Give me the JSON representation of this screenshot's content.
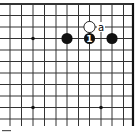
{
  "diagram": {
    "type": "go-board-corner",
    "colors": {
      "line": "#333333",
      "edge": "#111111",
      "black_stone": "#111111",
      "white_stone": "#ffffff",
      "background": "#ffffff"
    },
    "grid": {
      "x_lines": [
        10,
        21.5,
        33,
        44.5,
        56,
        67,
        78.5,
        89.5,
        101,
        112,
        123.5
      ],
      "y_lines": [
        4,
        15.5,
        27,
        38.5,
        50,
        61.5,
        73,
        84.5,
        96,
        107.5,
        119
      ],
      "top_edge": true,
      "right_edge": true
    },
    "star_points": [
      {
        "col": 2,
        "row": 3
      },
      {
        "col": 2,
        "row": 9
      },
      {
        "col": 8,
        "row": 9
      }
    ],
    "stones": [
      {
        "color": "black",
        "col": 5,
        "row": 3,
        "label": ""
      },
      {
        "color": "black",
        "col": 7,
        "row": 3,
        "label": "1"
      },
      {
        "color": "black",
        "col": 9,
        "row": 3,
        "label": ""
      },
      {
        "color": "white",
        "col": 7,
        "row": 2,
        "label": ""
      }
    ],
    "marks": [
      {
        "text": "a",
        "col": 8,
        "row": 2
      }
    ]
  }
}
